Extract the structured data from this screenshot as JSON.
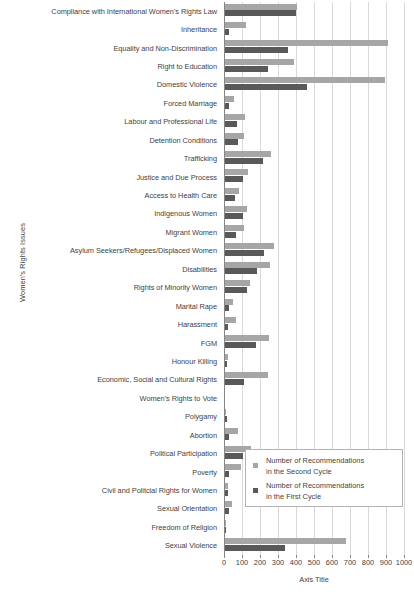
{
  "chart_data": {
    "type": "bar",
    "orientation": "horizontal",
    "title": "",
    "xlabel": "Axis Title",
    "ylabel": "Women's Rights Issues",
    "xlim": [
      0,
      1000
    ],
    "xticks": [
      0,
      100,
      200,
      300,
      400,
      500,
      600,
      700,
      800,
      900,
      1000
    ],
    "grid": true,
    "legend_position": "inside-bottom-right",
    "colors": {
      "second_cycle": "#a6a6a6",
      "first_cycle": "#595959",
      "gridline": "#d9d9d9",
      "axis": "#868686",
      "text": "#3f3f3f"
    },
    "categories": [
      "Compliance with International Women's Rights Law",
      "Inheritance",
      "Equality and Non-Discrimination",
      "Right to Education",
      "Domestic Violence",
      "Forced Marriage",
      "Labour and Professional Life",
      "Detention Conditions",
      "Trafficking",
      "Justice and Due Process",
      "Access to Health Care",
      "Indigenous Women",
      "Migrant Women",
      "Asylum Seekers/Refugees/Displaced Women",
      "Disabilities",
      "Rights of Minority Women",
      "Marital Rape",
      "Harassment",
      "FGM",
      "Honour Killing",
      "Economic, Social and Cultural Rights",
      "Women's Rights to Vote",
      "Polygamy",
      "Abortion",
      "Political Participation",
      "Poverty",
      "Civil and Politcial Rights for Women",
      "Sexual Orientation",
      "Freedom of Religion",
      "Sexual Violence"
    ],
    "series": [
      {
        "name": "Number of Recommendations in the Second Cycle",
        "color": "#a6a6a6",
        "values": [
          405,
          120,
          910,
          390,
          895,
          55,
          115,
          110,
          260,
          135,
          85,
          130,
          110,
          275,
          255,
          145,
          50,
          65,
          250,
          20,
          245,
          5,
          10,
          75,
          150,
          95,
          20,
          45,
          10,
          680
        ]
      },
      {
        "name": "Number of Recommendations in the First Cycle",
        "color": "#595959",
        "values": [
          400,
          25,
          355,
          245,
          460,
          30,
          70,
          75,
          215,
          105,
          60,
          105,
          65,
          220,
          185,
          125,
          30,
          20,
          180,
          15,
          110,
          5,
          15,
          25,
          105,
          30,
          20,
          25,
          10,
          340
        ]
      }
    ]
  },
  "legend": {
    "entries": [
      {
        "label_line1": "Number of Recommendations",
        "label_line2": "in the Second Cycle"
      },
      {
        "label_line1": "Number of Recommendations",
        "label_line2": "in the First Cycle"
      }
    ]
  },
  "axes": {
    "x_title": "Axis Title",
    "y_title": "Women's Rights Issues"
  }
}
